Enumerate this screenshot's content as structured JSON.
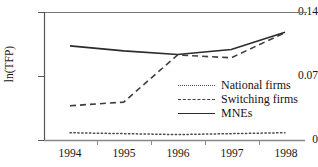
{
  "chart_data": {
    "type": "line",
    "title": "",
    "subtitle": "",
    "xlabel": "",
    "ylabel": "ln(TFP)",
    "x": [
      "1994",
      "1995",
      "1996",
      "1997",
      "1998"
    ],
    "categories": [
      "1994",
      "1995",
      "1996",
      "1997",
      "1998"
    ],
    "series": [
      {
        "name": "National firms",
        "style": "dotted",
        "color": "#4a4a4a",
        "values": [
          0.0085,
          0.0075,
          0.0065,
          0.0075,
          0.0085
        ]
      },
      {
        "name": "Switching firms",
        "style": "dashed",
        "color": "#3f3f3f",
        "values": [
          0.038,
          0.042,
          0.0935,
          0.0905,
          0.118
        ]
      },
      {
        "name": "MNEs",
        "style": "solid",
        "color": "#2b2b2b",
        "values": [
          0.1035,
          0.098,
          0.094,
          0.0995,
          0.1185
        ]
      }
    ],
    "ylim": [
      0,
      0.14
    ],
    "yticks": [
      0,
      0.07,
      0.14
    ],
    "ytick_labels": [
      "0",
      "0.07",
      "0.14"
    ],
    "xtick_labels": [
      "1994",
      "1995",
      "1996",
      "1997",
      "1998"
    ],
    "grid": false,
    "legend_position": "center-right",
    "legend_entries": [
      "National firms",
      "Switching firms",
      "MNEs"
    ]
  },
  "axis": {
    "y_title": "ln(TFP)",
    "y_ticks": {
      "top": "0.14",
      "mid": "0.07",
      "bottom": "0"
    },
    "x_ticks": [
      "1994",
      "1995",
      "1996",
      "1997",
      "1998"
    ]
  },
  "legend": {
    "items": [
      {
        "label": "National firms",
        "swatch": "dotted-line-swatch"
      },
      {
        "label": "Switching firms",
        "swatch": "dashed-line-swatch"
      },
      {
        "label": "MNEs",
        "swatch": "solid-line-swatch"
      }
    ]
  }
}
